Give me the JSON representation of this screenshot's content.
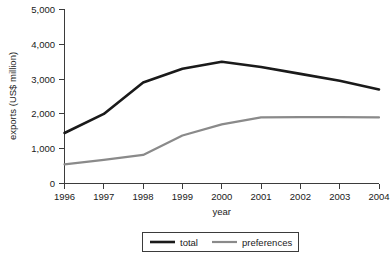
{
  "chart_data": {
    "type": "line",
    "title": "",
    "xlabel": "year",
    "ylabel": "exports (US$ million)",
    "categories": [
      "1996",
      "1997",
      "1998",
      "1999",
      "2000",
      "2001",
      "2002",
      "2003",
      "2004"
    ],
    "x": [
      1996,
      1997,
      1998,
      1999,
      2000,
      2001,
      2002,
      2003,
      2004
    ],
    "series": [
      {
        "name": "total",
        "color": "#1a1a1a",
        "values": [
          1450,
          2000,
          2900,
          3300,
          3500,
          3350,
          3150,
          2950,
          2700
        ]
      },
      {
        "name": "preferences",
        "color": "#8a8a8a",
        "values": [
          550,
          680,
          820,
          1380,
          1700,
          1900,
          1910,
          1905,
          1900
        ]
      }
    ],
    "ylim": [
      0,
      5000
    ],
    "ytick_values": [
      0,
      1000,
      2000,
      3000,
      4000,
      5000
    ],
    "ytick_labels": [
      "0",
      "1,000",
      "2,000",
      "3,000",
      "4,000",
      "5,000"
    ],
    "xtick_labels": [
      "1996",
      "1997",
      "1998",
      "1999",
      "2000",
      "2001",
      "2002",
      "2003",
      "2004"
    ],
    "grid": false,
    "legend_position": "bottom-center"
  },
  "legend": {
    "entries": [
      {
        "label": "total",
        "color": "#1a1a1a"
      },
      {
        "label": "preferences",
        "color": "#8a8a8a"
      }
    ]
  },
  "axes": {
    "y_title": "exports (US$ million)",
    "x_title": "year"
  }
}
